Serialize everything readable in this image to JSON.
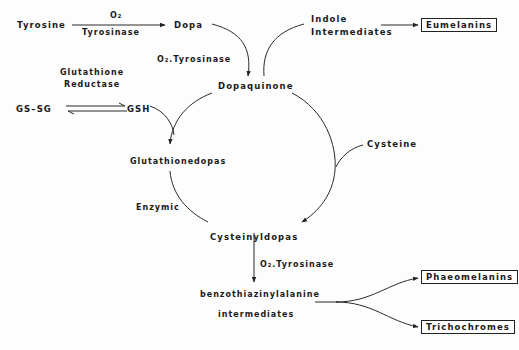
{
  "diagram": {
    "type": "metabolic-pathway",
    "nodes": {
      "tyrosine": "Tyrosine",
      "dopa": "Dopa",
      "dopaquinone": "Dopaquinone",
      "indole_1": "Indole",
      "indole_2": "Intermediates",
      "eumelanins": "Eumelanins",
      "gssg": "GS–SG",
      "gsh": "GSH",
      "glutathionedopas": "Glutathionedopas",
      "cysteine": "Cysteine",
      "cysteinyldopas": "Cysteinyldopas",
      "benzo_1": "benzothiazinylalanine",
      "benzo_2": "intermediates",
      "phaeomelanins": "Phaeomelanins",
      "trichochromes": "Trichochromes"
    },
    "edge_labels": {
      "tyr_dopa_top": "O₂",
      "tyr_dopa_bottom": "Tyrosinase",
      "dopa_dq": "O₂.Tyrosinase",
      "gr_1": "Glutathione",
      "gr_2": "Reductase",
      "enzymic": "Enzymic",
      "cys_benzo": "O₂.Tyrosinase"
    },
    "edges": [
      {
        "from": "Tyrosine",
        "to": "Dopa",
        "label": "O2 / Tyrosinase"
      },
      {
        "from": "Dopa",
        "to": "Dopaquinone",
        "label": "O2.Tyrosinase"
      },
      {
        "from": "Dopaquinone",
        "to": "Indole Intermediates"
      },
      {
        "from": "Indole Intermediates",
        "to": "Eumelanins"
      },
      {
        "from": "GS-SG",
        "to": "GSH",
        "label": "Glutathione Reductase",
        "reversible": true
      },
      {
        "from": "Dopaquinone",
        "to": "Glutathionedopas",
        "with": "GSH"
      },
      {
        "from": "Glutathionedopas",
        "to": "Cysteinyldopas",
        "label": "Enzymic"
      },
      {
        "from": "Dopaquinone",
        "to": "Cysteinyldopas",
        "with": "Cysteine"
      },
      {
        "from": "Cysteinyldopas",
        "to": "benzothiazinylalanine intermediates",
        "label": "O2.Tyrosinase"
      },
      {
        "from": "benzothiazinylalanine intermediates",
        "to": "Phaeomelanins"
      },
      {
        "from": "benzothiazinylalanine intermediates",
        "to": "Trichochromes"
      }
    ],
    "colors": {
      "ink": "#1a1a1a",
      "background": "#fdfdfd"
    }
  }
}
